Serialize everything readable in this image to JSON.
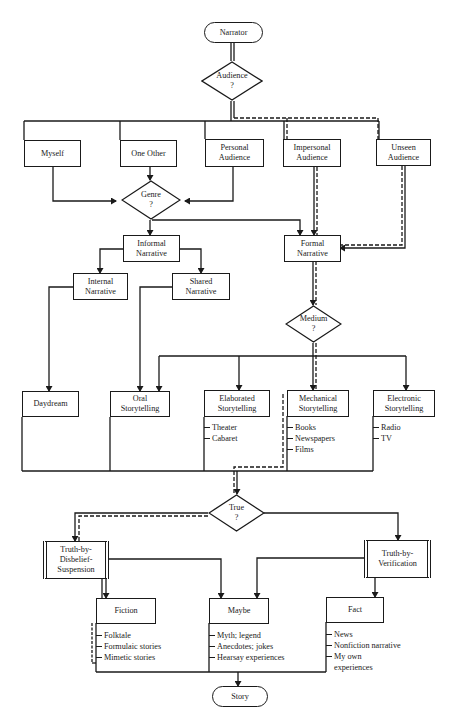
{
  "diagram": {
    "type": "flowchart",
    "start": {
      "label": "Narrator"
    },
    "end": {
      "label": "Story"
    },
    "decisions": {
      "audience": {
        "label": "Audience",
        "mark": "?"
      },
      "genre": {
        "label": "Genre",
        "mark": "?"
      },
      "medium": {
        "label": "Medium",
        "mark": "?"
      },
      "true": {
        "label": "True",
        "mark": "?"
      }
    },
    "audiences": [
      {
        "id": "myself",
        "label": "Myself"
      },
      {
        "id": "one-other",
        "label": "One Other"
      },
      {
        "id": "personal",
        "label": "Personal Audience"
      },
      {
        "id": "impersonal",
        "label": "Impersonal Audience"
      },
      {
        "id": "unseen",
        "label": "Unseen Audience"
      }
    ],
    "narratives": {
      "informal": "Informal Narrative",
      "formal": "Formal Narrative",
      "internal": "Internal Narrative",
      "shared": "Shared Narrative"
    },
    "media": [
      {
        "id": "daydream",
        "label": "Daydream",
        "items": []
      },
      {
        "id": "oral",
        "label": "Oral Storytelling",
        "items": []
      },
      {
        "id": "elaborated",
        "label": "Elaborated Storytelling",
        "items": [
          "Theater",
          "Cabaret"
        ]
      },
      {
        "id": "mechanical",
        "label": "Mechanical Storytelling",
        "items": [
          "Books",
          "Newspapers",
          "Films"
        ]
      },
      {
        "id": "electronic",
        "label": "Electronic Storytelling",
        "items": [
          "Radio",
          "TV"
        ]
      }
    ],
    "truth_modes": {
      "disbelief": "Truth-by-Disbelief-Suspension",
      "verification": "Truth-by-Verification"
    },
    "outcomes": [
      {
        "id": "fiction",
        "label": "Fiction",
        "items": [
          "Folktale",
          "Formulaic stories",
          "Mimetic stories"
        ]
      },
      {
        "id": "maybe",
        "label": "Maybe",
        "items": [
          "Myth; legend",
          "Anecdotes; jokes",
          "Hearsay experiences"
        ]
      },
      {
        "id": "fact",
        "label": "Fact",
        "items": [
          "News",
          "Nonfiction narrative",
          "My own",
          "experiences"
        ]
      }
    ],
    "highlighted_path": [
      "Narrator",
      "Audience ?",
      "Impersonal Audience / Unseen Audience",
      "Formal Narrative",
      "Medium ?",
      "Mechanical Storytelling",
      "True ?",
      "Truth-by-Disbelief-Suspension",
      "Fiction"
    ],
    "colors": {
      "line": "#1a1a1a",
      "background": "#ffffff"
    }
  }
}
